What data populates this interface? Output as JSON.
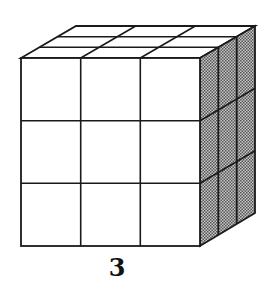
{
  "figure": {
    "label": "3",
    "grid_size": 3,
    "colors": {
      "stroke": "#1a1a1a",
      "front_fill": "#ffffff",
      "top_fill": "#ffffff",
      "side_fill": "#9a9a9a"
    }
  }
}
